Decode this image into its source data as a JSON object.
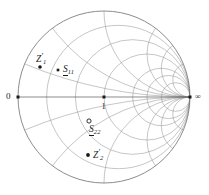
{
  "figure": {
    "kind": "smith-chart",
    "background_color": "#ffffff",
    "grid_color": "#8c8c8c",
    "outline_color": "#6e6e6e",
    "marker_color": "#1a1a1a"
  },
  "geometry": {
    "center_x": 104,
    "center_y": 97,
    "radius": 86
  },
  "axis_labels": {
    "left": "0",
    "center": "1",
    "right": "∞"
  },
  "markers": [
    {
      "id": "origin-point",
      "name": "origin-marker",
      "x": 18,
      "y": 97,
      "style": "filled-square",
      "size": 3.0,
      "label": null
    },
    {
      "id": "center-point",
      "name": "center-marker",
      "x": 104,
      "y": 97,
      "style": "filled-square",
      "size": 3.0,
      "label": "1"
    },
    {
      "id": "infinity-point",
      "name": "infinity-marker",
      "x": 190,
      "y": 97,
      "style": "filled-square",
      "size": 3.0,
      "label": "∞"
    },
    {
      "id": "z1-prime",
      "name": "z1-prime-marker",
      "x": 40,
      "y": 67,
      "style": "filled-small",
      "size": 1.8,
      "label": "Z1'"
    },
    {
      "id": "s11",
      "name": "s11-marker",
      "x": 58,
      "y": 70,
      "style": "filled-square",
      "size": 2.6,
      "label": "S11"
    },
    {
      "id": "s22",
      "name": "s22-marker",
      "x": 89,
      "y": 121,
      "style": "open-circle",
      "size": 2.1,
      "label": "S22"
    },
    {
      "id": "z2-prime",
      "name": "z2-prime-marker",
      "x": 88,
      "y": 155,
      "style": "filled-small",
      "size": 1.9,
      "label": "Z2'"
    }
  ],
  "annotations": {
    "z1_prime": {
      "base": "Z",
      "sub": "1",
      "prime": "′"
    },
    "s11": {
      "base": "S",
      "sub": "11",
      "underlined": true
    },
    "s22": {
      "base": "S",
      "sub": "22",
      "underlined": true
    },
    "z2_prime": {
      "base": "Z",
      "sub": "2",
      "prime": "′"
    }
  },
  "chart_data": {
    "type": "smith",
    "title": "",
    "xlabel": "",
    "ylabel": "",
    "resistance_circles": [
      0.2,
      0.5,
      1.0,
      2.0,
      3.0,
      5.0
    ],
    "reactance_arcs": [
      0.2,
      0.5,
      1.0,
      2.0,
      3.0,
      5.0
    ],
    "unit_circle": 1.0,
    "real_axis": true,
    "points": [
      {
        "label": "0",
        "gamma_re": -1.0,
        "gamma_im": 0.0
      },
      {
        "label": "1",
        "gamma_re": 0.0,
        "gamma_im": 0.0
      },
      {
        "label": "∞",
        "gamma_re": 1.0,
        "gamma_im": 0.0
      },
      {
        "label": "Z1'",
        "gamma_re": -0.744,
        "gamma_im": 0.349
      },
      {
        "label": "S11",
        "gamma_re": -0.535,
        "gamma_im": 0.314
      },
      {
        "label": "S22",
        "gamma_re": -0.174,
        "gamma_im": -0.279
      },
      {
        "label": "Z2'",
        "gamma_re": -0.186,
        "gamma_im": -0.674
      }
    ]
  }
}
